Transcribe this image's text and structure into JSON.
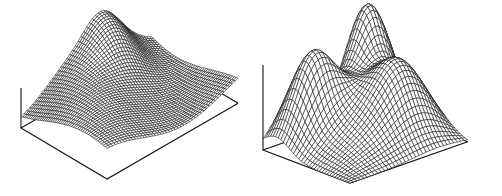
{
  "figure": {
    "width": 502,
    "height": 196,
    "background": "#ffffff",
    "line_color": "#111111",
    "panels": [
      {
        "id": "left-surface",
        "description": "wireframe surface plot with travelling wave shape",
        "grid": 46,
        "origin": [
          21,
          128
        ],
        "ex": [
          1.87,
          1.11
        ],
        "ey": [
          2.85,
          -1.65
        ],
        "ez": [
          0,
          -1
        ],
        "zscale": 78,
        "zaxis_height": 40,
        "surface": "wave"
      },
      {
        "id": "right-surface",
        "description": "wireframe surface plot with saddle-like double peak shape",
        "grid": 34,
        "origin": [
          263,
          150
        ],
        "ex": [
          1.89,
          0.72
        ],
        "ey": [
          2.56,
          -0.9
        ],
        "ez": [
          0,
          -1
        ],
        "zscale": 108,
        "zaxis_height": 85,
        "surface": "saddle"
      }
    ]
  }
}
